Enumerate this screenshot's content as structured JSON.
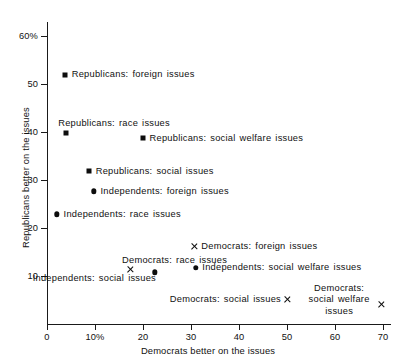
{
  "chart_data": {
    "type": "scatter",
    "title": "",
    "xlabel": "Democrats better on the issues",
    "ylabel": "Republicans better on the issues",
    "xlim": [
      0,
      72
    ],
    "ylim": [
      0,
      62
    ],
    "xticks": [
      "0",
      "10%",
      "20",
      "30",
      "40",
      "50",
      "60",
      "70"
    ],
    "xtickvalues": [
      0,
      10,
      20,
      30,
      40,
      50,
      60,
      70
    ],
    "yticks": [
      "10",
      "20",
      "30",
      "40",
      "50",
      "60%"
    ],
    "ytickvalues": [
      10,
      20,
      30,
      40,
      50,
      60
    ],
    "grid": false,
    "legend": "none",
    "points": [
      {
        "label": "Republicans: foreign issues",
        "x": 3.8,
        "y": 52.0,
        "marker": "square",
        "label_side": "right"
      },
      {
        "label": "Republicans: race issues",
        "x": 4.0,
        "y": 39.8,
        "marker": "square",
        "label_side": "above"
      },
      {
        "label": "Republicans: social welfare issues",
        "x": 20.0,
        "y": 38.7,
        "marker": "square",
        "label_side": "right"
      },
      {
        "label": "Republicans: social issues",
        "x": 8.8,
        "y": 31.9,
        "marker": "square",
        "label_side": "right"
      },
      {
        "label": "Independents: foreign issues",
        "x": 9.8,
        "y": 27.7,
        "marker": "circle",
        "label_side": "right"
      },
      {
        "label": "Independents: race issues",
        "x": 2.1,
        "y": 22.9,
        "marker": "circle",
        "label_side": "right"
      },
      {
        "label": "Democrats: foreign issues",
        "x": 30.8,
        "y": 16.2,
        "marker": "cross",
        "label_side": "right"
      },
      {
        "label": "Independents: social welfare issues",
        "x": 31.0,
        "y": 11.8,
        "marker": "circle",
        "label_side": "right"
      },
      {
        "label": "Democrats: race issues",
        "x": 17.3,
        "y": 11.4,
        "marker": "cross",
        "label_side": "above"
      },
      {
        "label": "Independents: social issues",
        "x": 22.5,
        "y": 10.8,
        "marker": "circle",
        "label_side": "below-left"
      },
      {
        "label": "Democrats: social issues",
        "x": 50.0,
        "y": 5.2,
        "marker": "cross",
        "label_side": "left"
      },
      {
        "label": "Democrats: social welfare issues",
        "x": 69.6,
        "y": 4.2,
        "marker": "cross",
        "label_side": "above-left-two-line"
      }
    ]
  },
  "colors": {
    "marker": "#0d0d0d",
    "axis": "#1a1a1a",
    "text": "#111111",
    "background": "#ffffff"
  }
}
